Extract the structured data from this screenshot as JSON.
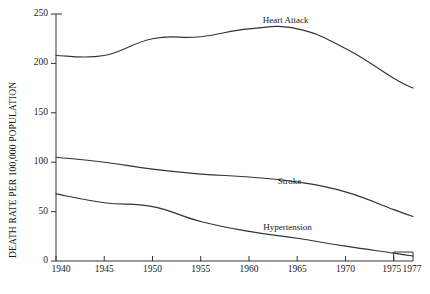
{
  "chart_data": {
    "type": "line",
    "title": "",
    "xlabel": "",
    "ylabel": "DEATH RATE PER 100,000 POPULATION",
    "xlim": [
      1940,
      1977
    ],
    "ylim": [
      0,
      250
    ],
    "grid": false,
    "legend_position": "inline-annotations",
    "x_ticks": [
      1940,
      1945,
      1950,
      1955,
      1960,
      1965,
      1970,
      1975,
      1977
    ],
    "x_tick_labels": [
      "1940",
      "1945",
      "1950",
      "1955",
      "1960",
      "1965",
      "1970",
      "1975",
      "1977"
    ],
    "y_ticks": [
      0,
      50,
      100,
      150,
      200,
      250
    ],
    "y_tick_labels": [
      "0",
      "50",
      "100",
      "150",
      "200",
      "250"
    ],
    "line_color": "#333333",
    "series": [
      {
        "name": "Heart Attack",
        "label_x": 1963.8,
        "label_y": 243,
        "x": [
          1940,
          1945,
          1950,
          1955,
          1960,
          1965,
          1970,
          1975,
          1977
        ],
        "values": [
          208,
          208,
          225,
          227,
          235,
          235,
          215,
          185,
          175
        ]
      },
      {
        "name": "Stroke",
        "label_x": 1964.2,
        "label_y": 80,
        "x": [
          1940,
          1945,
          1950,
          1955,
          1960,
          1965,
          1970,
          1975,
          1977
        ],
        "values": [
          105,
          100,
          93,
          88,
          85,
          80,
          70,
          52,
          45
        ]
      },
      {
        "name": "Hypertension",
        "label_x": 1964.0,
        "label_y": 33,
        "x": [
          1940,
          1945,
          1950,
          1955,
          1960,
          1965,
          1970,
          1975,
          1977
        ],
        "values": [
          68,
          59,
          55,
          40,
          30,
          23,
          15,
          8,
          5
        ]
      }
    ]
  }
}
